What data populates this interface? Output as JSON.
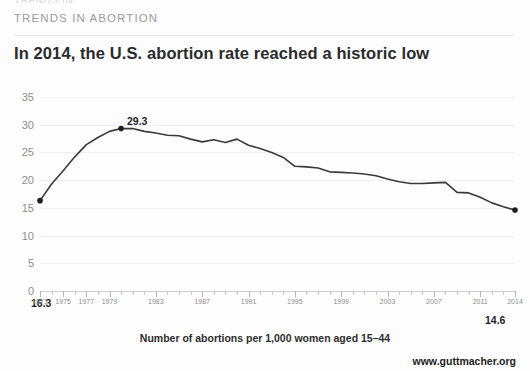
{
  "header": {
    "clipped_top_text": "TRENDS IN",
    "kicker": "TRENDS IN ABORTION",
    "headline": "In 2014, the U.S. abortion rate reached a historic low"
  },
  "caption": "Number of abortions per 1,000 women aged 15–44",
  "footer": "www.guttmacher.org",
  "colors": {
    "line": "#3a3a3a",
    "marker": "#1f1f1f",
    "grid": "#efefef",
    "axis_text": "#8e8e8e",
    "headline": "#2b2b2b",
    "kicker": "#9b9b9b",
    "background": "#fdfdfd"
  },
  "chart_data": {
    "type": "line",
    "title": "In 2014, the U.S. abortion rate reached a historic low",
    "subtitle": "TRENDS IN ABORTION",
    "xlabel": "",
    "ylabel": "",
    "axis_caption": "Number of abortions per 1,000 women aged 15–44",
    "grid": true,
    "legend": false,
    "legend_position": "none",
    "xlim": [
      1973,
      2014
    ],
    "ylim": [
      0,
      35
    ],
    "yticks": [
      0,
      5,
      10,
      15,
      20,
      25,
      30,
      35
    ],
    "ytick_labels": [
      "0",
      "5",
      "10",
      "15",
      "20",
      "25",
      "30",
      "35"
    ],
    "xtick_labels": [
      "1973",
      "1975",
      "1977",
      "1979",
      "1983",
      "1987",
      "1991",
      "1995",
      "1999",
      "2003",
      "2007",
      "2011",
      "2014"
    ],
    "xticks": [
      1973,
      1975,
      1977,
      1979,
      1983,
      1987,
      1991,
      1995,
      1999,
      2003,
      2007,
      2011,
      2014
    ],
    "x": [
      1973,
      1974,
      1975,
      1976,
      1977,
      1978,
      1979,
      1980,
      1981,
      1982,
      1983,
      1984,
      1985,
      1986,
      1987,
      1988,
      1989,
      1990,
      1991,
      1992,
      1993,
      1994,
      1995,
      1996,
      1997,
      1998,
      1999,
      2000,
      2001,
      2002,
      2003,
      2004,
      2005,
      2006,
      2007,
      2008,
      2009,
      2010,
      2011,
      2012,
      2013,
      2014
    ],
    "values": [
      16.3,
      19.3,
      21.7,
      24.2,
      26.4,
      27.7,
      28.8,
      29.3,
      29.3,
      28.8,
      28.5,
      28.1,
      28.0,
      27.4,
      26.9,
      27.3,
      26.8,
      27.4,
      26.3,
      25.7,
      25.0,
      24.1,
      22.5,
      22.4,
      22.2,
      21.5,
      21.4,
      21.3,
      21.1,
      20.8,
      20.2,
      19.7,
      19.4,
      19.4,
      19.5,
      19.6,
      17.8,
      17.7,
      16.9,
      15.9,
      15.2,
      14.6
    ],
    "annotations": [
      {
        "label": "16.3",
        "year": 1973,
        "value": 16.3,
        "position": "below-left"
      },
      {
        "label": "29.3",
        "year": 1980,
        "value": 29.3,
        "position": "above"
      },
      {
        "label": "14.6",
        "year": 2014,
        "value": 14.6,
        "position": "below-right"
      }
    ],
    "markers": [
      {
        "year": 1973,
        "value": 16.3
      },
      {
        "year": 1980,
        "value": 29.3
      },
      {
        "year": 2014,
        "value": 14.6
      }
    ]
  }
}
